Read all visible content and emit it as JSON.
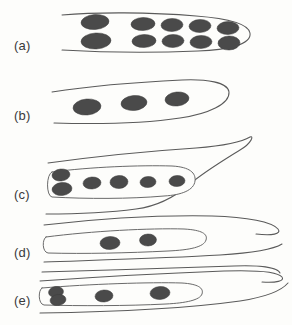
{
  "figure": {
    "background_color": "#fdfdfb",
    "outline_color": "#5a5a5a",
    "nucleus_color": "#4a4a4a",
    "label_color": "#3a3a3a",
    "width": 292,
    "height": 325
  },
  "panels": [
    {
      "id": "a",
      "label": "(a)",
      "label_x": 14,
      "label_y": 50,
      "description": "Broad tube with rounded right cap containing two rows of nuclei",
      "nucleus_count": 10,
      "nucleus_rows": 2,
      "outline_path": "M 62 15 C 95 12, 150 12, 196 16 C 222 18, 248 22, 250 33 C 252 45, 226 50, 198 51 C 150 53, 96 52, 62 50",
      "inner_path": "",
      "nuclei": [
        {
          "cx": 95,
          "cy": 22,
          "rx": 14,
          "ry": 7.5,
          "rot": -4
        },
        {
          "cx": 96,
          "cy": 41,
          "rx": 15,
          "ry": 8,
          "rot": -3
        },
        {
          "cx": 143,
          "cy": 24,
          "rx": 12,
          "ry": 6.5,
          "rot": -2
        },
        {
          "cx": 144,
          "cy": 41,
          "rx": 12,
          "ry": 6.5,
          "rot": -2
        },
        {
          "cx": 172,
          "cy": 25,
          "rx": 11,
          "ry": 6.5,
          "rot": -2
        },
        {
          "cx": 173,
          "cy": 41,
          "rx": 11,
          "ry": 6.5,
          "rot": -2
        },
        {
          "cx": 200,
          "cy": 26,
          "rx": 11,
          "ry": 6.5,
          "rot": -2
        },
        {
          "cx": 201,
          "cy": 42,
          "rx": 11,
          "ry": 6.5,
          "rot": -2
        },
        {
          "cx": 228,
          "cy": 28,
          "rx": 11,
          "ry": 6.5,
          "rot": -2
        },
        {
          "cx": 229,
          "cy": 43,
          "rx": 11,
          "ry": 7,
          "rot": -2
        }
      ]
    },
    {
      "id": "b",
      "label": "(b)",
      "label_x": 14,
      "label_y": 120,
      "description": "Tapered leaf-shaped cell with one row of three nuclei",
      "nucleus_count": 3,
      "nucleus_rows": 1,
      "outline_path": "M 52 92 C 90 86, 140 82, 182 80 C 206 79, 228 82, 229 92 C 230 104, 208 114, 180 118 C 140 124, 88 124, 54 123",
      "inner_path": "",
      "nuclei": [
        {
          "cx": 87,
          "cy": 107,
          "rx": 14,
          "ry": 8,
          "rot": -5
        },
        {
          "cx": 134,
          "cy": 103,
          "rx": 13,
          "ry": 7.5,
          "rot": -5
        },
        {
          "cx": 177,
          "cy": 99,
          "rx": 12,
          "ry": 7,
          "rot": -6
        }
      ]
    },
    {
      "id": "c",
      "label": "(c)",
      "label_x": 14,
      "label_y": 199,
      "description": "Cell with pointed hooked tip and inner rounded tube containing a nucleus doublet plus four nuclei",
      "nucleus_count": 6,
      "nucleus_rows": 2,
      "outline_path": "M 48 163 C 92 157, 150 151, 196 148 C 220 146, 242 142, 250 137 C 254 135, 252 143, 240 150 C 224 160, 204 172, 190 184 C 176 196, 160 206, 136 209 C 106 213, 72 214, 46 214",
      "inner_path": "M 52 172 C 90 167, 140 165, 172 166 C 190 167, 196 173, 195 181 C 194 190, 182 195, 164 196 C 130 199, 86 199, 52 197 C 46 196, 46 174, 52 172 Z",
      "nuclei": [
        {
          "cx": 61,
          "cy": 175,
          "rx": 9,
          "ry": 6,
          "rot": -6
        },
        {
          "cx": 62,
          "cy": 189,
          "rx": 10,
          "ry": 6.5,
          "rot": -6
        },
        {
          "cx": 92,
          "cy": 183,
          "rx": 9,
          "ry": 6,
          "rot": -4
        },
        {
          "cx": 119,
          "cy": 182,
          "rx": 9,
          "ry": 6.5,
          "rot": -4
        },
        {
          "cx": 148,
          "cy": 182,
          "rx": 8,
          "ry": 5.5,
          "rot": -4
        },
        {
          "cx": 177,
          "cy": 181,
          "rx": 8,
          "ry": 5.5,
          "rot": -4
        }
      ]
    },
    {
      "id": "d",
      "label": "(d)",
      "label_x": 14,
      "label_y": 257,
      "description": "Slender cell with long tapering tip and inner tube containing two nuclei",
      "nucleus_count": 2,
      "nucleus_rows": 1,
      "outline_path": "M 44 225 C 96 219, 160 215, 212 216 C 248 217, 272 222, 278 229 C 282 234, 272 236, 256 234",
      "inner_path": "M 46 237 C 92 231, 150 228, 184 229 C 202 230, 208 234, 206 240 C 204 247, 190 250, 168 251 C 128 253, 84 254, 48 253 C 42 252, 42 239, 46 237 Z",
      "extra_paths": [
        "M 44 262 C 100 260, 170 258, 220 255 C 252 253, 274 249, 282 244",
        "M 42 272 C 104 270, 180 268, 234 266 C 262 265, 278 268, 280 273"
      ],
      "nuclei": [
        {
          "cx": 110,
          "cy": 243,
          "rx": 10,
          "ry": 6.5,
          "rot": -3
        },
        {
          "cx": 148,
          "cy": 240,
          "rx": 8.5,
          "ry": 6,
          "rot": -3
        }
      ]
    },
    {
      "id": "e",
      "label": "(e)",
      "label_x": 14,
      "label_y": 305,
      "description": "Narrow tube cell with a nucleus doublet and two nuclei, broad curved lower body",
      "nucleus_count": 3,
      "nucleus_rows": 1,
      "outline_path": "M 40 281 C 96 277, 170 273, 224 271 C 256 270, 278 272, 282 277 C 285 281, 276 283, 262 282",
      "inner_path": "M 42 288 C 90 284, 150 282, 182 283 C 198 284, 204 288, 202 294 C 200 300, 186 303, 166 304 C 126 306, 80 306, 44 305 C 38 304, 38 290, 42 288 Z",
      "extra_paths": [
        "M 40 313 C 110 312, 190 308, 240 301 C 266 297, 282 290, 288 283"
      ],
      "nuclei": [
        {
          "cx": 56,
          "cy": 292,
          "rx": 7.5,
          "ry": 5.5,
          "rot": -8
        },
        {
          "cx": 58,
          "cy": 300,
          "rx": 8,
          "ry": 5.5,
          "rot": -8
        },
        {
          "cx": 104,
          "cy": 296,
          "rx": 9,
          "ry": 6,
          "rot": -4
        },
        {
          "cx": 160,
          "cy": 293,
          "rx": 10,
          "ry": 6.5,
          "rot": -4
        }
      ]
    }
  ]
}
